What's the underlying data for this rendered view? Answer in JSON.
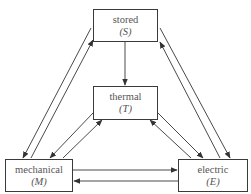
{
  "diagram": {
    "type": "energy-conversion-triangle",
    "nodes": {
      "stored": {
        "label": "stored",
        "symbol": "(S)"
      },
      "thermal": {
        "label": "thermal",
        "symbol": "(T)"
      },
      "mechanical": {
        "label": "mechanical",
        "symbol": "(M)"
      },
      "electric": {
        "label": "electric",
        "symbol": "(E)"
      }
    },
    "edges": [
      {
        "from": "stored",
        "to": "thermal"
      },
      {
        "from": "stored",
        "to": "mechanical"
      },
      {
        "from": "mechanical",
        "to": "stored"
      },
      {
        "from": "stored",
        "to": "electric"
      },
      {
        "from": "electric",
        "to": "stored"
      },
      {
        "from": "thermal",
        "to": "mechanical"
      },
      {
        "from": "mechanical",
        "to": "thermal"
      },
      {
        "from": "thermal",
        "to": "electric"
      },
      {
        "from": "electric",
        "to": "thermal"
      },
      {
        "from": "mechanical",
        "to": "electric"
      },
      {
        "from": "electric",
        "to": "mechanical"
      }
    ],
    "colors": {
      "line": "#4a4a4a",
      "text": "#555555",
      "box_border": "#3a3a3a"
    }
  }
}
